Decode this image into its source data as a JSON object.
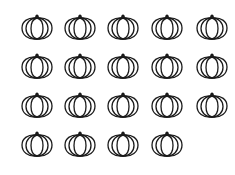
{
  "grid": {
    "columns": 5,
    "rows": 4,
    "count": 19,
    "col_x": [
      21,
      64,
      107,
      151,
      196
    ],
    "row_y": [
      13,
      52,
      91,
      130
    ],
    "icon": "pumpkin-icon",
    "stroke_color": "#1a1a1a",
    "background": "#ffffff"
  }
}
